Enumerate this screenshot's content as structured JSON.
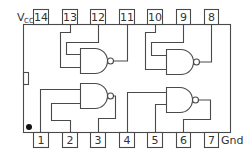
{
  "chip": {
    "supply_label": "V",
    "supply_sub": "CC",
    "ground_label": "Gnd",
    "top_pins": [
      "14",
      "13",
      "12",
      "11",
      "10",
      "9",
      "8"
    ],
    "bottom_pins": [
      "1",
      "2",
      "3",
      "4",
      "5",
      "6",
      "7"
    ],
    "gates": [
      {
        "id": "gate-1",
        "type": "NAND",
        "inputs": [
          "1",
          "2"
        ],
        "output": "3"
      },
      {
        "id": "gate-2",
        "type": "NAND",
        "inputs": [
          "4",
          "5"
        ],
        "output": "6"
      },
      {
        "id": "gate-3",
        "type": "NAND",
        "inputs": [
          "13",
          "12"
        ],
        "output": "11"
      },
      {
        "id": "gate-4",
        "type": "NAND",
        "inputs": [
          "10",
          "9"
        ],
        "output": "8"
      }
    ],
    "colors": {
      "line": "#4a4a4a",
      "background": "#ffffff",
      "text": "#333333"
    }
  }
}
